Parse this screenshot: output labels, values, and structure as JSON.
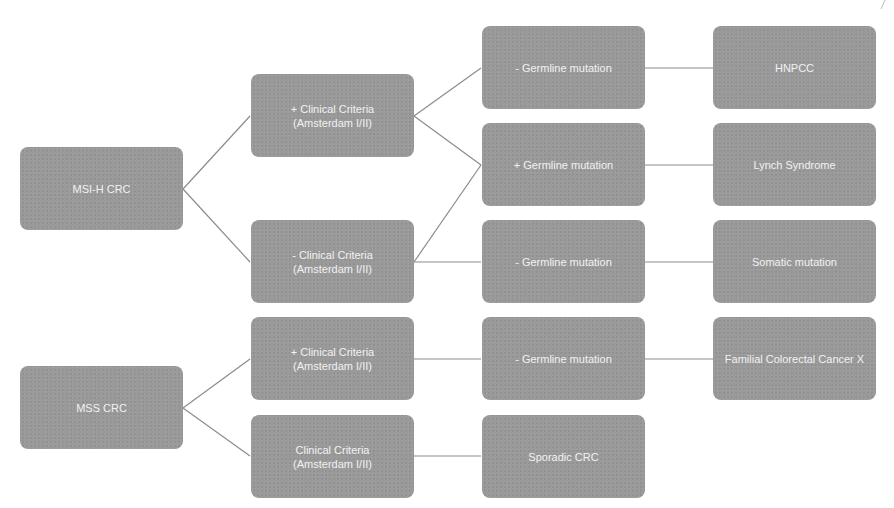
{
  "diagram": {
    "type": "flowchart",
    "colors": {
      "node_fill": "#9a9a9a",
      "node_text": "#f2f2f2",
      "connector": "#8c8c8c",
      "background": "#ffffff"
    },
    "nodes": {
      "msi_h_crc": "MSI-H CRC",
      "mss_crc": "MSS CRC",
      "msi_pos_clinical": "+ Clinical Criteria\n(Amsterdam I/II)",
      "msi_neg_clinical": "- Clinical Criteria\n(Amsterdam I/II)",
      "mss_pos_clinical": "+ Clinical Criteria\n(Amsterdam I/II)",
      "mss_clinical": "Clinical Criteria\n(Amsterdam I/II)",
      "neg_germline_1": "- Germline mutation",
      "pos_germline": "+ Germline mutation",
      "neg_germline_2": "- Germline  mutation",
      "neg_germline_3": "- Germline mutation",
      "sporadic_crc": "Sporadic CRC",
      "hnpcc": "HNPCC",
      "lynch_syndrome": "Lynch Syndrome",
      "somatic_mutation": "Somatic mutation",
      "familial_crc_x": "Familial Colorectal Cancer X"
    },
    "edges": [
      [
        "msi_h_crc",
        "msi_pos_clinical"
      ],
      [
        "msi_h_crc",
        "msi_neg_clinical"
      ],
      [
        "msi_pos_clinical",
        "neg_germline_1"
      ],
      [
        "msi_pos_clinical",
        "pos_germline"
      ],
      [
        "msi_neg_clinical",
        "pos_germline"
      ],
      [
        "msi_neg_clinical",
        "neg_germline_2"
      ],
      [
        "neg_germline_1",
        "hnpcc"
      ],
      [
        "pos_germline",
        "lynch_syndrome"
      ],
      [
        "neg_germline_2",
        "somatic_mutation"
      ],
      [
        "mss_crc",
        "mss_pos_clinical"
      ],
      [
        "mss_crc",
        "mss_clinical"
      ],
      [
        "mss_pos_clinical",
        "neg_germline_3"
      ],
      [
        "mss_clinical",
        "sporadic_crc"
      ],
      [
        "neg_germline_3",
        "familial_crc_x"
      ]
    ]
  }
}
